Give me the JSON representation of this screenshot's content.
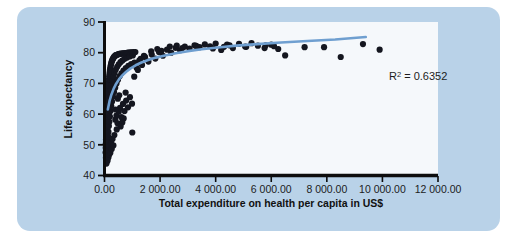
{
  "chart_data": {
    "type": "scatter",
    "title": "",
    "xlabel": "Total expenditure on health per capita in US$",
    "ylabel": "Life expectancy",
    "xlim": [
      0,
      12000
    ],
    "ylim": [
      40,
      90
    ],
    "grid": false,
    "legend": null,
    "xticks": [
      0,
      2000,
      4000,
      6000,
      8000,
      10000,
      12000
    ],
    "xtick_labels": [
      "0.00",
      "2 000.00",
      "4 000.00",
      "6 000.00",
      "8 000.00",
      "10 000.00",
      "12 000.00"
    ],
    "yticks": [
      40,
      50,
      60,
      70,
      80,
      90
    ],
    "ytick_labels": [
      "40",
      "50",
      "60",
      "70",
      "80",
      "90"
    ],
    "annotations": [
      {
        "name": "r-squared",
        "text_prefix": "R",
        "text_sup": "2",
        "text_suffix": " = 0.6352",
        "value": 0.6352,
        "x": 10050,
        "y": 74.6
      }
    ],
    "marker": {
      "color": "#14161f",
      "size": 3.1,
      "shape": "circle"
    },
    "trendline": {
      "name": "logarithmic-fit",
      "color": "#6f9fd0",
      "width": 2.6,
      "type": "logarithmic",
      "x_start": 120,
      "x_end": 9400,
      "y_start": 61.5,
      "y_end": 85.1,
      "points": [
        [
          120,
          61.5
        ],
        [
          180,
          64.2
        ],
        [
          250,
          66.4
        ],
        [
          330,
          68.3
        ],
        [
          420,
          69.9
        ],
        [
          520,
          71.3
        ],
        [
          640,
          72.6
        ],
        [
          780,
          73.8
        ],
        [
          940,
          74.9
        ],
        [
          1120,
          75.9
        ],
        [
          1330,
          76.8
        ],
        [
          1570,
          77.6
        ],
        [
          1850,
          78.4
        ],
        [
          2180,
          79.1
        ],
        [
          2560,
          79.8
        ],
        [
          3000,
          80.5
        ],
        [
          3500,
          81.1
        ],
        [
          4080,
          81.7
        ],
        [
          4750,
          82.3
        ],
        [
          5500,
          82.8
        ],
        [
          6350,
          83.3
        ],
        [
          7300,
          83.8
        ],
        [
          8300,
          84.3
        ],
        [
          9400,
          85.1
        ]
      ]
    },
    "points": [
      [
        40,
        47.5
      ],
      [
        45,
        49.0
      ],
      [
        48,
        50.4
      ],
      [
        52,
        45.8
      ],
      [
        55,
        51.7
      ],
      [
        58,
        48.2
      ],
      [
        60,
        53.1
      ],
      [
        63,
        46.6
      ],
      [
        66,
        54.5
      ],
      [
        70,
        50.0
      ],
      [
        72,
        55.8
      ],
      [
        75,
        52.3
      ],
      [
        78,
        57.0
      ],
      [
        80,
        47.9
      ],
      [
        84,
        58.4
      ],
      [
        86,
        53.6
      ],
      [
        90,
        59.7
      ],
      [
        93,
        49.3
      ],
      [
        96,
        60.9
      ],
      [
        100,
        55.1
      ],
      [
        103,
        62.2
      ],
      [
        106,
        51.2
      ],
      [
        110,
        63.4
      ],
      [
        113,
        56.6
      ],
      [
        117,
        64.7
      ],
      [
        120,
        58.0
      ],
      [
        124,
        65.9
      ],
      [
        127,
        52.8
      ],
      [
        131,
        67.0
      ],
      [
        134,
        60.3
      ],
      [
        138,
        68.2
      ],
      [
        142,
        54.2
      ],
      [
        146,
        69.3
      ],
      [
        150,
        61.8
      ],
      [
        154,
        70.4
      ],
      [
        158,
        56.1
      ],
      [
        162,
        71.4
      ],
      [
        166,
        63.2
      ],
      [
        170,
        72.3
      ],
      [
        175,
        57.5
      ],
      [
        180,
        73.1
      ],
      [
        185,
        64.9
      ],
      [
        190,
        73.9
      ],
      [
        195,
        59.2
      ],
      [
        200,
        74.6
      ],
      [
        206,
        66.4
      ],
      [
        212,
        75.2
      ],
      [
        218,
        61.0
      ],
      [
        224,
        75.8
      ],
      [
        230,
        68.0
      ],
      [
        236,
        76.3
      ],
      [
        243,
        62.6
      ],
      [
        250,
        76.8
      ],
      [
        257,
        69.5
      ],
      [
        264,
        77.2
      ],
      [
        272,
        64.1
      ],
      [
        280,
        77.6
      ],
      [
        288,
        70.9
      ],
      [
        296,
        77.9
      ],
      [
        305,
        65.7
      ],
      [
        314,
        78.2
      ],
      [
        323,
        72.2
      ],
      [
        332,
        78.5
      ],
      [
        342,
        67.2
      ],
      [
        352,
        78.7
      ],
      [
        362,
        73.4
      ],
      [
        373,
        78.9
      ],
      [
        384,
        68.6
      ],
      [
        395,
        79.1
      ],
      [
        407,
        74.5
      ],
      [
        419,
        79.2
      ],
      [
        431,
        70.0
      ],
      [
        444,
        79.3
      ],
      [
        457,
        75.4
      ],
      [
        470,
        79.4
      ],
      [
        484,
        71.2
      ],
      [
        498,
        79.5
      ],
      [
        513,
        76.2
      ],
      [
        528,
        79.6
      ],
      [
        543,
        72.3
      ],
      [
        559,
        79.6
      ],
      [
        575,
        76.9
      ],
      [
        592,
        79.7
      ],
      [
        609,
        73.3
      ],
      [
        627,
        79.7
      ],
      [
        645,
        77.5
      ],
      [
        664,
        79.8
      ],
      [
        683,
        74.2
      ],
      [
        703,
        79.8
      ],
      [
        723,
        78.0
      ],
      [
        744,
        79.9
      ],
      [
        766,
        75.0
      ],
      [
        788,
        79.9
      ],
      [
        811,
        78.4
      ],
      [
        834,
        80.0
      ],
      [
        858,
        75.7
      ],
      [
        883,
        80.0
      ],
      [
        909,
        78.8
      ],
      [
        935,
        80.1
      ],
      [
        962,
        76.3
      ],
      [
        990,
        80.1
      ],
      [
        1019,
        79.1
      ],
      [
        1048,
        80.2
      ],
      [
        1079,
        76.8
      ],
      [
        1110,
        80.2
      ],
      [
        60,
        44.6
      ],
      [
        70,
        43.9
      ],
      [
        85,
        45.2
      ],
      [
        95,
        46.3
      ],
      [
        110,
        44.8
      ],
      [
        125,
        47.1
      ],
      [
        140,
        45.9
      ],
      [
        155,
        48.3
      ],
      [
        170,
        46.8
      ],
      [
        190,
        49.4
      ],
      [
        210,
        47.4
      ],
      [
        235,
        50.6
      ],
      [
        260,
        48.6
      ],
      [
        290,
        51.9
      ],
      [
        320,
        49.8
      ],
      [
        355,
        53.2
      ],
      [
        390,
        58.2
      ],
      [
        430,
        59.5
      ],
      [
        470,
        57.0
      ],
      [
        515,
        60.8
      ],
      [
        560,
        62.0
      ],
      [
        610,
        59.0
      ],
      [
        665,
        63.3
      ],
      [
        720,
        61.0
      ],
      [
        780,
        64.4
      ],
      [
        845,
        62.2
      ],
      [
        915,
        65.5
      ],
      [
        990,
        63.4
      ],
      [
        1000,
        54.0
      ],
      [
        1070,
        72.2
      ],
      [
        1155,
        75.1
      ],
      [
        1250,
        77.4
      ],
      [
        1350,
        76.0
      ],
      [
        1460,
        78.6
      ],
      [
        1580,
        77.1
      ],
      [
        1700,
        79.4
      ],
      [
        1830,
        78.1
      ],
      [
        1960,
        80.2
      ],
      [
        2100,
        79.0
      ],
      [
        2250,
        81.0
      ],
      [
        2400,
        80.0
      ],
      [
        2560,
        81.6
      ],
      [
        2720,
        80.8
      ],
      [
        2890,
        82.0
      ],
      [
        3060,
        81.3
      ],
      [
        3240,
        82.4
      ],
      [
        3420,
        81.8
      ],
      [
        3610,
        82.7
      ],
      [
        3800,
        82.1
      ],
      [
        4000,
        83.0
      ],
      [
        4200,
        80.9
      ],
      [
        4410,
        82.6
      ],
      [
        4620,
        81.5
      ],
      [
        4840,
        82.9
      ],
      [
        5060,
        82.0
      ],
      [
        5290,
        83.1
      ],
      [
        5520,
        82.3
      ],
      [
        5760,
        81.5
      ],
      [
        6000,
        82.6
      ],
      [
        6250,
        81.2
      ],
      [
        6500,
        79.1
      ],
      [
        7200,
        81.8
      ],
      [
        7900,
        81.8
      ],
      [
        8500,
        78.6
      ],
      [
        9300,
        82.8
      ],
      [
        9900,
        81.0
      ],
      [
        2800,
        81.5
      ],
      [
        3300,
        82.2
      ],
      [
        4500,
        82.4
      ],
      [
        5100,
        81.9
      ],
      [
        5800,
        82.4
      ],
      [
        2050,
        80.6
      ],
      [
        2350,
        82.0
      ],
      [
        1420,
        79.0
      ],
      [
        1680,
        80.4
      ],
      [
        1900,
        81.2
      ],
      [
        2600,
        82.3
      ],
      [
        3900,
        81.4
      ],
      [
        4300,
        81.9
      ],
      [
        6100,
        82.1
      ],
      [
        1200,
        74.4
      ],
      [
        1300,
        78.0
      ],
      [
        760,
        67.0
      ],
      [
        690,
        58.6
      ],
      [
        640,
        57.3
      ],
      [
        580,
        56.0
      ],
      [
        530,
        66.1
      ],
      [
        480,
        65.0
      ],
      [
        440,
        55.0
      ],
      [
        400,
        61.5
      ]
    ]
  }
}
